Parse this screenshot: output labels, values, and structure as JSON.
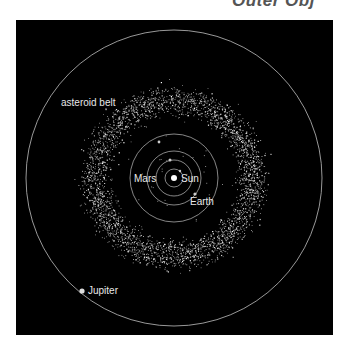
{
  "title": "Outer Obj",
  "labels": {
    "asteroid_belt": "asteroid belt",
    "mars": "Mars",
    "sun": "Sun",
    "earth": "Earth",
    "jupiter": "Jupiter"
  },
  "colors": {
    "background": "#000000",
    "orbit": "#bfbfbf",
    "text": "#e8e8e8",
    "page": "#ffffff"
  },
  "geometry": {
    "center": [
      174,
      178
    ],
    "orbits": [
      {
        "name": "mercury",
        "r": 9
      },
      {
        "name": "venus",
        "r": 18
      },
      {
        "name": "earth",
        "r": 27
      },
      {
        "name": "mars",
        "r": 44
      },
      {
        "name": "jupiter",
        "r": 148
      }
    ],
    "belt_inner_r": 58,
    "belt_outer_r": 100
  }
}
